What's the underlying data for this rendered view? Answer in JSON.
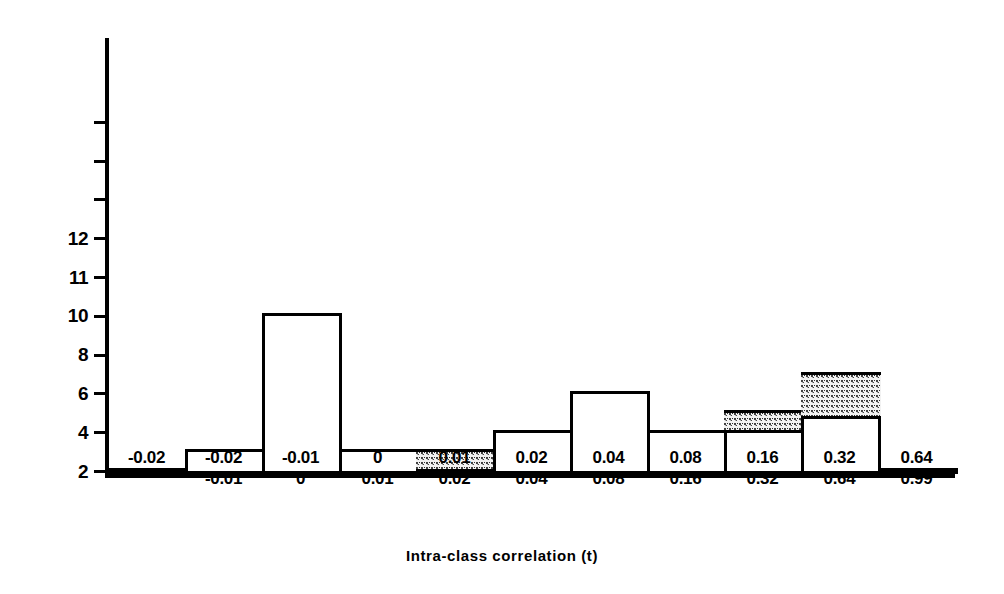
{
  "chart_data": {
    "type": "bar",
    "title": "",
    "xlabel": "Intra-class correlation (t)",
    "ylabel": "No. of occurences",
    "grid": false,
    "legend": "none",
    "ylim": [
      0,
      15
    ],
    "y_ticks": [
      {
        "value": 2,
        "label": "2"
      },
      {
        "value": 4,
        "label": "4"
      },
      {
        "value": 6,
        "label": "6"
      },
      {
        "value": 8,
        "label": "8"
      },
      {
        "value": 10,
        "label": "10"
      },
      {
        "value": 11,
        "label": "11"
      },
      {
        "value": 12,
        "label": "12"
      },
      {
        "value": 13,
        "label": ""
      },
      {
        "value": 14,
        "label": ""
      },
      {
        "value": 15,
        "label": ""
      }
    ],
    "x_ticks": [
      {
        "line1": "-0.02",
        "line2": ""
      },
      {
        "line1": "-0.02",
        "line2": "-0.01"
      },
      {
        "line1": "-0.01",
        "line2": "0"
      },
      {
        "line1": "0",
        "line2": "0.01"
      },
      {
        "line1": "0.01",
        "line2": "0.02"
      },
      {
        "line1": "0.02",
        "line2": "0.04"
      },
      {
        "line1": "0.04",
        "line2": "0.08"
      },
      {
        "line1": "0.08",
        "line2": "0.16"
      },
      {
        "line1": "0.16",
        "line2": "0.32"
      },
      {
        "line1": "0.32",
        "line2": "0.64"
      },
      {
        "line1": "0.64",
        "line2": "0.99"
      }
    ],
    "categories": [
      "-0.02",
      "-0.02 to -0.01",
      "-0.01 to 0",
      "0 to 0.01",
      "0.01 to 0.02",
      "0.02 to 0.04",
      "0.04 to 0.08",
      "0.08 to 0.16",
      "0.16 to 0.32",
      "0.32 to 0.64",
      "0.64 to 0.99"
    ],
    "values": [
      2,
      3,
      10,
      3,
      3,
      4,
      6,
      4,
      5,
      7,
      2
    ],
    "series": [
      {
        "name": "unshaded",
        "values": [
          2,
          3,
          10,
          3,
          1.8,
          4,
          6,
          4,
          4,
          4.7,
          1
        ]
      },
      {
        "name": "shaded",
        "values": [
          0,
          0,
          0,
          0,
          1.2,
          0,
          0,
          0,
          1,
          2.3,
          1
        ]
      }
    ],
    "bars": [
      {
        "index": 0,
        "total": 2,
        "shade_from": 0,
        "shade_to": 0
      },
      {
        "index": 1,
        "total": 3,
        "shade_from": 0,
        "shade_to": 0
      },
      {
        "index": 2,
        "total": 10,
        "shade_from": 0,
        "shade_to": 0
      },
      {
        "index": 3,
        "total": 3,
        "shade_from": 0,
        "shade_to": 0
      },
      {
        "index": 4,
        "total": 3,
        "shade_from": 1.8,
        "shade_to": 3
      },
      {
        "index": 5,
        "total": 4,
        "shade_from": 0,
        "shade_to": 0
      },
      {
        "index": 6,
        "total": 6,
        "shade_from": 0,
        "shade_to": 0
      },
      {
        "index": 7,
        "total": 4,
        "shade_from": 0,
        "shade_to": 0
      },
      {
        "index": 8,
        "total": 5,
        "shade_from": 4,
        "shade_to": 5
      },
      {
        "index": 9,
        "total": 7,
        "shade_from": 4.7,
        "shade_to": 7
      },
      {
        "index": 10,
        "total": 2,
        "shade_from": 1,
        "shade_to": 2
      }
    ]
  }
}
